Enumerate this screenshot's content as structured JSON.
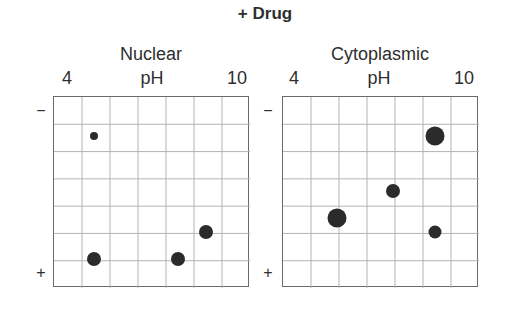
{
  "figure": {
    "title": "+ Drug",
    "panels": [
      {
        "name": "Nuclear",
        "x_axis": {
          "label": "pH",
          "min_label": "4",
          "max_label": "10"
        },
        "y_axis": {
          "top_label": "−",
          "bottom_label": "+"
        }
      },
      {
        "name": "Cytoplasmic",
        "x_axis": {
          "label": "pH",
          "min_label": "4",
          "max_label": "10"
        },
        "y_axis": {
          "top_label": "−",
          "bottom_label": "+"
        }
      }
    ]
  },
  "colors": {
    "text": "#2e2e2e",
    "border": "#6a6a6a",
    "gridline": "#b4b4b4",
    "spot": "#2b2b2b"
  },
  "chart_data": [
    {
      "type": "scatter",
      "title": "Nuclear",
      "subtitle": "+ Drug",
      "xlabel": "pH",
      "ylabel": "charge (− top, + bottom)",
      "xlim": [
        4,
        10
      ],
      "x_tick_labels": [
        "4",
        "10"
      ],
      "grid": {
        "on": true,
        "columns": 7,
        "rows": 7
      },
      "points_grid_units": [
        {
          "col": 1.5,
          "row": 1.5,
          "size": "small",
          "diameter_px": 8
        },
        {
          "col": 1.5,
          "row": 6.0,
          "size": "medium",
          "diameter_px": 14
        },
        {
          "col": 4.5,
          "row": 6.0,
          "size": "medium",
          "diameter_px": 14
        },
        {
          "col": 5.5,
          "row": 5.0,
          "size": "medium",
          "diameter_px": 14
        }
      ]
    },
    {
      "type": "scatter",
      "title": "Cytoplasmic",
      "subtitle": "+ Drug",
      "xlabel": "pH",
      "ylabel": "charge (− top, + bottom)",
      "xlim": [
        4,
        10
      ],
      "x_tick_labels": [
        "4",
        "10"
      ],
      "grid": {
        "on": true,
        "columns": 7,
        "rows": 7
      },
      "points_grid_units": [
        {
          "col": 5.5,
          "row": 1.5,
          "size": "large",
          "diameter_px": 19
        },
        {
          "col": 4.0,
          "row": 3.5,
          "size": "medium",
          "diameter_px": 14
        },
        {
          "col": 2.0,
          "row": 4.5,
          "size": "large",
          "diameter_px": 19
        },
        {
          "col": 5.5,
          "row": 5.0,
          "size": "medium",
          "diameter_px": 13
        }
      ]
    }
  ]
}
